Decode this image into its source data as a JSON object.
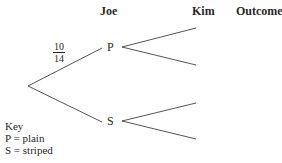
{
  "headers": {
    "joe": "Joe",
    "kim": "Kim",
    "outcome": "Outcome"
  },
  "nodes": {
    "first_upper": "P",
    "first_lower": "S"
  },
  "probabilities": {
    "root_to_P": {
      "numerator": "10",
      "denominator": "14"
    }
  },
  "key": {
    "title": "Key",
    "lines": [
      "P = plain",
      "S = striped"
    ]
  },
  "colors": {
    "ink": "#2a2a2a"
  }
}
